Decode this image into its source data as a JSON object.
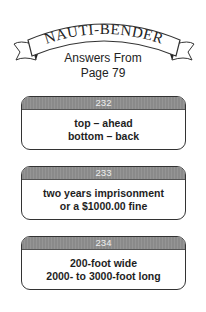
{
  "header": {
    "banner_title": "NAUTI-BENDER",
    "subtitle_line1": "Answers From",
    "subtitle_line2": "Page 79"
  },
  "cards": [
    {
      "number": "232",
      "lines": [
        "top – ahead",
        "bottom – back"
      ]
    },
    {
      "number": "233",
      "lines": [
        "two years imprisonment",
        "or a $1000.00 fine"
      ]
    },
    {
      "number": "234",
      "lines": [
        "200-foot wide",
        "2000- to 3000-foot long"
      ]
    }
  ],
  "colors": {
    "card_header": "#8e8e8e",
    "card_border": "#333333",
    "text": "#1a1a1a"
  }
}
